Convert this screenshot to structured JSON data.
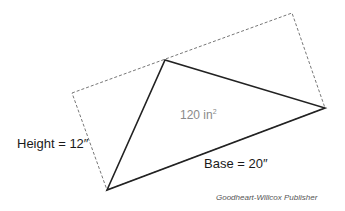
{
  "diagram": {
    "labels": {
      "height": "Height = 12″",
      "base": "Base = 20″",
      "area_value": "120 in",
      "area_exponent": "2"
    },
    "credit": "Goodheart-Willcox Publisher",
    "colors": {
      "triangle_stroke": "#222222",
      "rectangle_stroke": "#777777",
      "area_text": "#8a8a8a"
    },
    "geometry": {
      "triangle": [
        [
          107,
          190
        ],
        [
          165,
          60
        ],
        [
          325,
          108
        ]
      ],
      "rectangle": [
        [
          72,
          93
        ],
        [
          292,
          13
        ],
        [
          325,
          108
        ],
        [
          107,
          190
        ]
      ]
    }
  }
}
